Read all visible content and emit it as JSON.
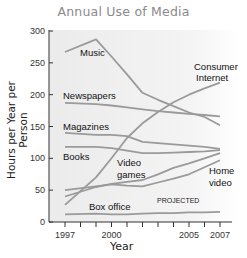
{
  "chart_data": {
    "type": "line",
    "title": "Annual Use of Media",
    "xlabel": "Year",
    "ylabel": "Hours per Year per Person",
    "ylim": [
      0,
      300
    ],
    "xlim": [
      1997,
      2007
    ],
    "y_ticks": [
      0,
      50,
      100,
      150,
      200,
      250,
      300
    ],
    "x_ticks": [
      1997,
      1998,
      1999,
      2000,
      2001,
      2002,
      2003,
      2004,
      2005,
      2006,
      2007
    ],
    "x_tick_labels": [
      "1997",
      "2000",
      "2005",
      "2007"
    ],
    "grid": false,
    "annotation": "PROJECTED",
    "x": [
      1997,
      1999,
      2000,
      2001,
      2002,
      2003,
      2004,
      2005,
      2006,
      2007
    ],
    "series": [
      {
        "name": "Music",
        "points": [
          [
            1997,
            267
          ],
          [
            1999,
            287
          ],
          [
            2000,
            260
          ],
          [
            2001,
            232
          ],
          [
            2002,
            203
          ],
          [
            2003,
            192
          ],
          [
            2004,
            182
          ],
          [
            2005,
            172
          ],
          [
            2006,
            165
          ],
          [
            2007,
            152
          ]
        ]
      },
      {
        "name": "Newspapers",
        "points": [
          [
            1997,
            187
          ],
          [
            1999,
            185
          ],
          [
            2000,
            183
          ],
          [
            2001,
            180
          ],
          [
            2002,
            177
          ],
          [
            2003,
            174
          ],
          [
            2004,
            172
          ],
          [
            2005,
            170
          ],
          [
            2006,
            168
          ],
          [
            2007,
            166
          ]
        ]
      },
      {
        "name": "Magazines",
        "points": [
          [
            1997,
            140
          ],
          [
            1999,
            137
          ],
          [
            2000,
            137
          ],
          [
            2001,
            135
          ],
          [
            2002,
            126
          ],
          [
            2003,
            124
          ],
          [
            2004,
            122
          ],
          [
            2005,
            120
          ],
          [
            2006,
            118
          ],
          [
            2007,
            115
          ]
        ]
      },
      {
        "name": "Books",
        "points": [
          [
            1997,
            118
          ],
          [
            1999,
            118
          ],
          [
            2000,
            116
          ],
          [
            2001,
            112
          ],
          [
            2002,
            108
          ],
          [
            2003,
            108
          ],
          [
            2004,
            109
          ],
          [
            2005,
            110
          ],
          [
            2006,
            111
          ],
          [
            2007,
            113
          ]
        ]
      },
      {
        "name": "Consumer Internet",
        "points": [
          [
            1997,
            27
          ],
          [
            1999,
            70
          ],
          [
            2000,
            100
          ],
          [
            2001,
            132
          ],
          [
            2002,
            155
          ],
          [
            2003,
            173
          ],
          [
            2004,
            188
          ],
          [
            2005,
            200
          ],
          [
            2006,
            210
          ],
          [
            2007,
            219
          ]
        ]
      },
      {
        "name": "Video games",
        "points": [
          [
            1997,
            40
          ],
          [
            1999,
            55
          ],
          [
            2000,
            60
          ],
          [
            2001,
            63
          ],
          [
            2002,
            66
          ],
          [
            2003,
            75
          ],
          [
            2004,
            85
          ],
          [
            2005,
            92
          ],
          [
            2006,
            100
          ],
          [
            2007,
            108
          ]
        ]
      },
      {
        "name": "Home video",
        "points": [
          [
            1997,
            50
          ],
          [
            1999,
            56
          ],
          [
            2000,
            59
          ],
          [
            2001,
            57
          ],
          [
            2002,
            56
          ],
          [
            2003,
            62
          ],
          [
            2004,
            68
          ],
          [
            2005,
            75
          ],
          [
            2006,
            86
          ],
          [
            2007,
            97
          ]
        ]
      },
      {
        "name": "Box office",
        "points": [
          [
            1997,
            12
          ],
          [
            1999,
            13
          ],
          [
            2000,
            12
          ],
          [
            2001,
            12
          ],
          [
            2002,
            13
          ],
          [
            2003,
            14
          ],
          [
            2004,
            14
          ],
          [
            2005,
            15
          ],
          [
            2006,
            15
          ],
          [
            2007,
            16
          ]
        ]
      }
    ],
    "series_labels": {
      "music": "Music",
      "newspapers": "Newspapers",
      "magazines": "Magazines",
      "books": "Books",
      "consumer_internet_1": "Consumer",
      "consumer_internet_2": "Internet",
      "video_games_1": "Video",
      "video_games_2": "games",
      "home_video_1": "Home",
      "home_video_2": "video",
      "box_office": "Box office"
    },
    "colors": {
      "line": "#9a9a9a",
      "axis": "#333333",
      "title": "#8a8a8a",
      "plot_bg_left": "#ececec",
      "plot_bg_right": "#ffffff"
    }
  }
}
